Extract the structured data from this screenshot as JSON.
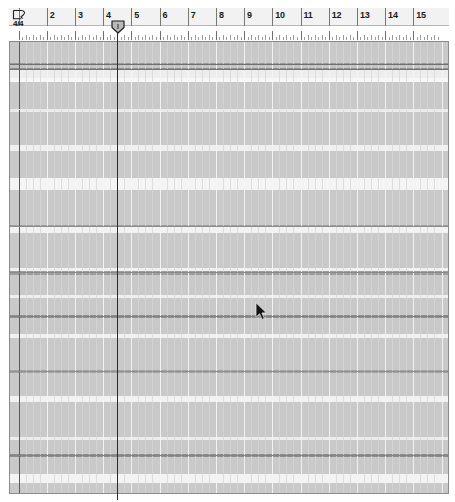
{
  "app": {
    "view_name": "arrangement-grid",
    "background_color": "#ffffff",
    "grid_color": "#c9c9c9"
  },
  "ruler": {
    "name": "bar-ruler",
    "time_signature": "4/4",
    "time_signature_bar": 1,
    "beats_per_bar": 4,
    "first_visible_bar": 1,
    "last_visible_bar": 15,
    "bar_width_px": 28.2,
    "bar_numbers": [
      {
        "bar": 1,
        "label": ""
      },
      {
        "bar": 2,
        "label": "2"
      },
      {
        "bar": 3,
        "label": "3"
      },
      {
        "bar": 4,
        "label": "4"
      },
      {
        "bar": 5,
        "label": "5"
      },
      {
        "bar": 6,
        "label": "6"
      },
      {
        "bar": 7,
        "label": "7"
      },
      {
        "bar": 8,
        "label": "8"
      },
      {
        "bar": 9,
        "label": "9"
      },
      {
        "bar": 10,
        "label": "10"
      },
      {
        "bar": 11,
        "label": "11"
      },
      {
        "bar": 12,
        "label": "12"
      },
      {
        "bar": 13,
        "label": "13"
      },
      {
        "bar": 14,
        "label": "14"
      },
      {
        "bar": 15,
        "label": "15"
      }
    ]
  },
  "playhead": {
    "name": "position-marker",
    "bar": 4,
    "x_px": 118,
    "line_color": "#2b2b2b"
  },
  "cursor": {
    "name": "mouse-pointer",
    "x_px": 256,
    "y_px": 303
  },
  "grid": {
    "name": "track-grid",
    "top_px": 42,
    "height_px": 451,
    "lane_fill": "#c9c9c9",
    "lane_highlight": "#f2f2f2",
    "separator_dark": "#7a7a7a",
    "separator_light": "#ffffff",
    "lanes": [
      {
        "y": 0,
        "h": 21,
        "fill": "#c9c9c9"
      },
      {
        "y": 21,
        "h": 2,
        "fill": "#9a9a9a"
      },
      {
        "y": 23,
        "h": 3,
        "fill": "#c4c4c4"
      },
      {
        "y": 26,
        "h": 2,
        "fill": "#8f8f8f"
      },
      {
        "y": 28,
        "h": 8,
        "fill": "#ededed"
      },
      {
        "y": 36,
        "h": 4,
        "fill": "#f7f7f7"
      },
      {
        "y": 40,
        "h": 28,
        "fill": "#c9c9c9"
      },
      {
        "y": 68,
        "h": 2,
        "fill": "#ececec"
      },
      {
        "y": 70,
        "h": 33,
        "fill": "#c9c9c9"
      },
      {
        "y": 103,
        "h": 6,
        "fill": "#f0f0f0"
      },
      {
        "y": 109,
        "h": 27,
        "fill": "#c9c9c9"
      },
      {
        "y": 136,
        "h": 12,
        "fill": "#f4f4f4"
      },
      {
        "y": 148,
        "h": 35,
        "fill": "#c9c9c9"
      },
      {
        "y": 183,
        "h": 2,
        "fill": "#9e9e9e"
      },
      {
        "y": 185,
        "h": 6,
        "fill": "#f2f2f2"
      },
      {
        "y": 191,
        "h": 35,
        "fill": "#c9c9c9"
      },
      {
        "y": 226,
        "h": 3,
        "fill": "#f0f0f0"
      },
      {
        "y": 229,
        "h": 4,
        "fill": "#9d9d9d"
      },
      {
        "y": 233,
        "h": 20,
        "fill": "#c9c9c9"
      },
      {
        "y": 253,
        "h": 3,
        "fill": "#efefef"
      },
      {
        "y": 256,
        "h": 17,
        "fill": "#c9c9c9"
      },
      {
        "y": 273,
        "h": 3,
        "fill": "#8f8f8f"
      },
      {
        "y": 276,
        "h": 16,
        "fill": "#c9c9c9"
      },
      {
        "y": 292,
        "h": 4,
        "fill": "#f1f1f1"
      },
      {
        "y": 296,
        "h": 32,
        "fill": "#c9c9c9"
      },
      {
        "y": 328,
        "h": 3,
        "fill": "#a3a3a3"
      },
      {
        "y": 331,
        "h": 23,
        "fill": "#c9c9c9"
      },
      {
        "y": 354,
        "h": 6,
        "fill": "#f2f2f2"
      },
      {
        "y": 360,
        "h": 35,
        "fill": "#c9c9c9"
      },
      {
        "y": 395,
        "h": 3,
        "fill": "#ececec"
      },
      {
        "y": 398,
        "h": 14,
        "fill": "#c9c9c9"
      },
      {
        "y": 412,
        "h": 3,
        "fill": "#8d8d8d"
      },
      {
        "y": 415,
        "h": 17,
        "fill": "#c9c9c9"
      },
      {
        "y": 432,
        "h": 9,
        "fill": "#f3f3f3"
      },
      {
        "y": 441,
        "h": 10,
        "fill": "#c9c9c9"
      }
    ],
    "separators": [
      {
        "y": 22,
        "color": "#6f6f6f"
      },
      {
        "y": 27,
        "color": "#747474"
      },
      {
        "y": 67,
        "color": "#e9e9e9"
      },
      {
        "y": 184,
        "color": "#8b8b8b"
      },
      {
        "y": 230,
        "color": "#8a8a8a"
      },
      {
        "y": 274,
        "color": "#828282"
      },
      {
        "y": 329,
        "color": "#909090"
      },
      {
        "y": 413,
        "color": "#848484"
      }
    ]
  }
}
